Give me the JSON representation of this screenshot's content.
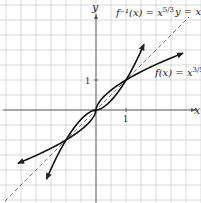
{
  "chart_data": {
    "type": "line",
    "title": "",
    "xlabel": "x",
    "ylabel": "y",
    "xlim": [
      -3.2,
      3.4
    ],
    "ylim": [
      -3.2,
      3.6
    ],
    "grid": true,
    "grid_step": 0.5,
    "ticks": {
      "x": [
        "1"
      ],
      "y": [
        "1"
      ]
    },
    "series": [
      {
        "name": "f(x) = x^(3/5)",
        "label": "f(x) = x",
        "exponent": "3/5",
        "style": "solid-arrow"
      },
      {
        "name": "f^-1(x) = x^(5/3)",
        "label": "f⁻¹(x) = x",
        "exponent": "5/3",
        "style": "solid-arrow"
      },
      {
        "name": "y = x",
        "label": "y = x",
        "style": "dashed"
      }
    ],
    "intersections": [
      [
        -1,
        -1
      ],
      [
        0,
        0
      ],
      [
        1,
        1
      ]
    ]
  },
  "labels": {
    "x_axis": "x",
    "y_axis": "y",
    "x_tick": "1",
    "y_tick": "1",
    "f_label": "f(x) = x",
    "f_exp": "3/5",
    "finv_label": "f⁻¹(x) = x",
    "finv_exp": "5/3",
    "identity_label": "y = x"
  }
}
